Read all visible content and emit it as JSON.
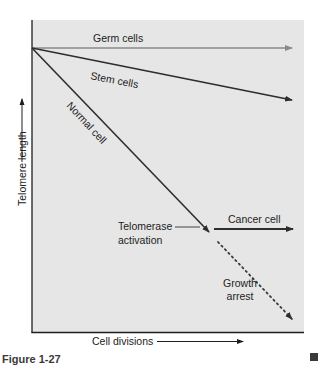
{
  "figure": {
    "caption": "Figure 1-27",
    "corner_marker": "square-marker"
  },
  "axes": {
    "x_label": "Cell divisions",
    "y_label": "Telomere length"
  },
  "lines": {
    "germ": {
      "label": "Germ cells",
      "color": "#8a8a8a",
      "style": "solid"
    },
    "stem": {
      "label": "Stem cells",
      "color": "#2e2e2e",
      "style": "solid"
    },
    "normal": {
      "label": "Normal cell",
      "color": "#2e2e2e",
      "style": "solid"
    },
    "cancer": {
      "label": "Cancer cell",
      "color": "#2e2e2e",
      "style": "solid"
    },
    "arrest": {
      "label_line1": "Growth",
      "label_line2": "arrest",
      "color": "#3a3a3a",
      "style": "dotted"
    }
  },
  "annotations": {
    "telomerase_line1": "Telomerase",
    "telomerase_line2": "activation"
  },
  "colors": {
    "plot_background": "#e6e6e6",
    "axis": "#1e1e1e",
    "text": "#222222",
    "marker": "#3a3a3a"
  }
}
